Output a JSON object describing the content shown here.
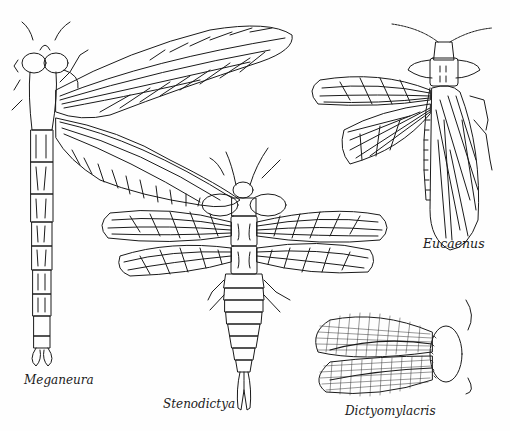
{
  "page": {
    "background": "#fefefe",
    "ink_color": "#1a1a1a"
  },
  "figures": [
    {
      "id": "meganeura",
      "label": "Meganeura",
      "icon": "dragonfly-illustration"
    },
    {
      "id": "stenodictya",
      "label": "Stenodictya",
      "icon": "palaeodictyopteran-illustration"
    },
    {
      "id": "eucaenus",
      "label": "Eucaenus",
      "icon": "orthopteroid-illustration"
    },
    {
      "id": "dictyomylacris",
      "label": "Dictyomylacris",
      "icon": "cockroach-illustration"
    }
  ]
}
